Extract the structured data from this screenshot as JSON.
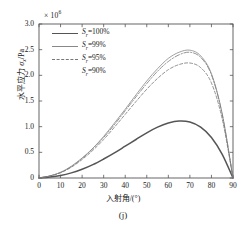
{
  "figure": {
    "panel_id": "(j)",
    "exponent_label": "× 10",
    "exponent_power": "6"
  },
  "axes": {
    "ylabel_prefix": "水平应力 ",
    "ylabel_symbol": "σ",
    "ylabel_subscript": "x",
    "ylabel_unit": "/Pa",
    "xlabel": "入射角/(°)",
    "yticks": [
      "0",
      "0.5",
      "1.0",
      "1.5",
      "2.0",
      "2.5",
      "3.0"
    ],
    "xticks": [
      "0",
      "10",
      "20",
      "30",
      "40",
      "50",
      "60",
      "70",
      "80",
      "90"
    ]
  },
  "legend": {
    "items": [
      {
        "prefix": "S",
        "sub": "r",
        "value": "=100%",
        "style": "solid-thick",
        "color": "#555555"
      },
      {
        "prefix": "S",
        "sub": "r",
        "value": "=99%",
        "style": "solid-thin",
        "color": "#888888"
      },
      {
        "prefix": "S",
        "sub": "r",
        "value": "=95%",
        "style": "dashed",
        "color": "#777777"
      },
      {
        "prefix": "S",
        "sub": "r",
        "value": "=90%",
        "style": "dashdot",
        "color": "#777777"
      }
    ]
  },
  "chart_data": {
    "type": "line",
    "title": "",
    "subtitle": "",
    "panel": "(j)",
    "xlabel": "入射角/(°)",
    "ylabel": "水平应力 σx/Pa",
    "y_scale_factor": 1000000,
    "y_scale_label": "× 10^6",
    "xlim": [
      0,
      90
    ],
    "ylim": [
      0,
      3.0
    ],
    "xticks": [
      0,
      10,
      20,
      30,
      40,
      50,
      60,
      70,
      80,
      90
    ],
    "yticks": [
      0,
      0.5,
      1.0,
      1.5,
      2.0,
      2.5,
      3.0
    ],
    "grid": false,
    "legend_position": "upper-left-inside",
    "x": [
      0,
      5,
      10,
      15,
      20,
      25,
      30,
      35,
      40,
      45,
      50,
      55,
      60,
      65,
      70,
      75,
      80,
      85,
      90
    ],
    "series": [
      {
        "name": "Sr=100%",
        "style": "solid-thick",
        "color": "#555555",
        "values": [
          0,
          0.02,
          0.05,
          0.1,
          0.17,
          0.26,
          0.37,
          0.49,
          0.62,
          0.75,
          0.88,
          0.99,
          1.07,
          1.11,
          1.09,
          0.99,
          0.79,
          0.46,
          0
        ],
        "peak_x": 64,
        "peak_y": 1.11
      },
      {
        "name": "Sr=99%",
        "style": "solid-thin",
        "color": "#888888",
        "values": [
          0,
          0.04,
          0.11,
          0.23,
          0.39,
          0.58,
          0.81,
          1.07,
          1.34,
          1.62,
          1.89,
          2.13,
          2.33,
          2.45,
          2.49,
          2.38,
          2.03,
          1.25,
          0
        ],
        "peak_x": 70,
        "peak_y": 2.49
      },
      {
        "name": "Sr=95%",
        "style": "dashed",
        "color": "#777777",
        "values": [
          0,
          0.04,
          0.1,
          0.21,
          0.36,
          0.54,
          0.75,
          0.99,
          1.24,
          1.49,
          1.73,
          1.94,
          2.11,
          2.21,
          2.24,
          2.15,
          1.85,
          1.15,
          0
        ],
        "peak_x": 69,
        "peak_y": 2.24
      },
      {
        "name": "Sr=90%",
        "style": "dashdot",
        "color": "#777777",
        "values": [
          0,
          0.04,
          0.11,
          0.22,
          0.38,
          0.57,
          0.79,
          1.04,
          1.31,
          1.58,
          1.84,
          2.08,
          2.27,
          2.4,
          2.45,
          2.35,
          2.01,
          1.24,
          0
        ],
        "peak_x": 70,
        "peak_y": 2.46
      }
    ]
  }
}
